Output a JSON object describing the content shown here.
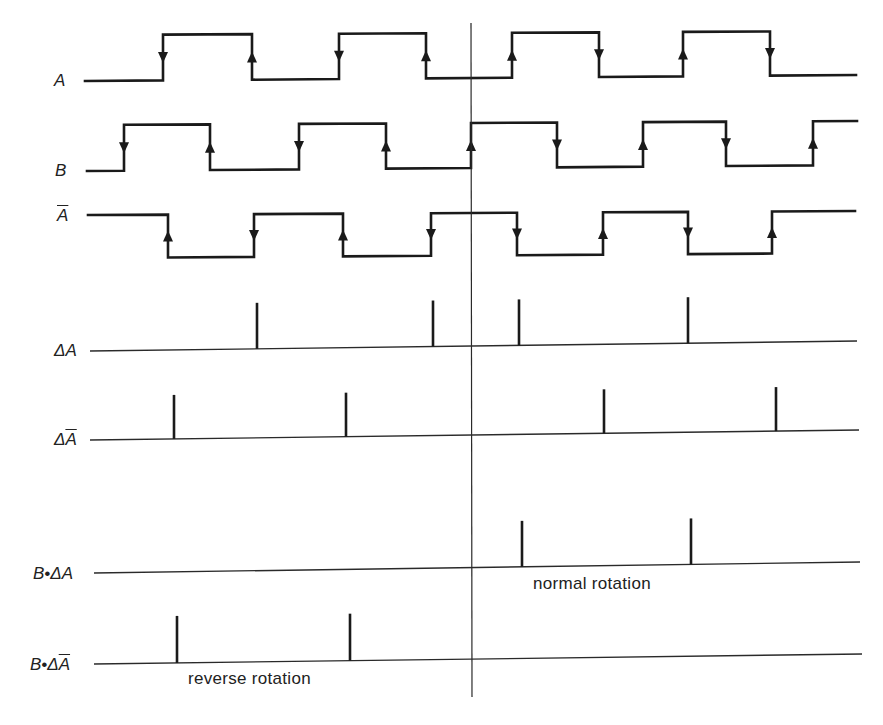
{
  "diagram": {
    "marker_x": 471,
    "marker_y": [
      23,
      697
    ],
    "signals": [
      {
        "id": "A",
        "label": "A",
        "label_overbar": "",
        "label_pos": [
          54,
          72
        ],
        "high_y": 35,
        "low_y": 81,
        "start_x": 85,
        "end_x": 856,
        "start_level": "low",
        "edges": [
          {
            "x": 163,
            "arrow": "down"
          },
          {
            "x": 252,
            "arrow": "up"
          },
          {
            "x": 339,
            "arrow": "down"
          },
          {
            "x": 426,
            "arrow": "up"
          },
          {
            "x": 512,
            "arrow": "up"
          },
          {
            "x": 599,
            "arrow": "down"
          },
          {
            "x": 683,
            "arrow": "up"
          },
          {
            "x": 770,
            "arrow": "down"
          }
        ]
      },
      {
        "id": "B",
        "label": "B",
        "label_overbar": "",
        "label_pos": [
          55,
          162
        ],
        "high_y": 125,
        "low_y": 171,
        "right_high_y": 121,
        "right_low_y": 165,
        "start_x": 87,
        "end_x": 857,
        "start_level": "low",
        "edges": [
          {
            "x": 124,
            "arrow": "down"
          },
          {
            "x": 210,
            "arrow": "up"
          },
          {
            "x": 299,
            "arrow": "down"
          },
          {
            "x": 386,
            "arrow": "up"
          },
          {
            "x": 471,
            "arrow": "up"
          },
          {
            "x": 557,
            "arrow": "down"
          },
          {
            "x": 643,
            "arrow": "up"
          },
          {
            "x": 726,
            "arrow": "down"
          },
          {
            "x": 813,
            "arrow": "up"
          }
        ]
      },
      {
        "id": "A_bar",
        "label": "A",
        "label_overbar": "true",
        "label_pos": [
          57,
          207
        ],
        "high_y": 215,
        "low_y": 258,
        "right_high_y": 211,
        "right_low_y": 253,
        "start_x": 88,
        "end_x": 855,
        "start_level": "high",
        "edges": [
          {
            "x": 168,
            "arrow": "up"
          },
          {
            "x": 254,
            "arrow": "down"
          },
          {
            "x": 343,
            "arrow": "up"
          },
          {
            "x": 431,
            "arrow": "down"
          },
          {
            "x": 517,
            "arrow": "down"
          },
          {
            "x": 603,
            "arrow": "up"
          },
          {
            "x": 688,
            "arrow": "down"
          },
          {
            "x": 772,
            "arrow": "up"
          }
        ]
      }
    ],
    "pulse_rows": [
      {
        "id": "delta_A",
        "label_prefix": "Δ",
        "label_main": "A",
        "label_overbar": false,
        "label_pos": [
          54,
          342
        ],
        "line_y_left": 351,
        "line_y_right": 341,
        "line_start_x": 90,
        "line_end_x": 857,
        "pulse_height": 46,
        "pulses_x": [
          257,
          433,
          519,
          688
        ]
      },
      {
        "id": "delta_A_bar",
        "label_prefix": "Δ",
        "label_main": "A",
        "label_overbar": true,
        "label_pos": [
          54,
          431
        ],
        "line_y_left": 440,
        "line_y_right": 430,
        "line_start_x": 90,
        "line_end_x": 859,
        "pulse_height": 44,
        "pulses_x": [
          174,
          346,
          604,
          776
        ]
      },
      {
        "id": "B_delta_A",
        "label_prefix": "B•Δ",
        "label_main": "A",
        "label_overbar": false,
        "label_pos": [
          33,
          565
        ],
        "line_y_left": 573,
        "line_y_right": 562,
        "line_start_x": 94,
        "line_end_x": 860,
        "pulse_height": 46,
        "pulses_x": [
          522,
          691
        ]
      },
      {
        "id": "B_delta_A_bar",
        "label_prefix": "B•Δ",
        "label_main": "A",
        "label_overbar": true,
        "label_pos": [
          30,
          656
        ],
        "line_y_left": 664,
        "line_y_right": 654,
        "line_start_x": 94,
        "line_end_x": 862,
        "pulse_height": 47,
        "pulses_x": [
          177,
          350
        ]
      }
    ],
    "captions": [
      {
        "text": "normal rotation",
        "x": 533,
        "y": 575
      },
      {
        "text": "reverse rotation",
        "x": 188,
        "y": 670
      }
    ]
  },
  "labels": {
    "a": "A",
    "b": "B",
    "a_bar": "A",
    "delta_a_prefix": "Δ",
    "delta_a_main": "A",
    "delta_a_bar_prefix": "Δ",
    "delta_a_bar_main": "A",
    "b_delta_a_prefix": "B•Δ",
    "b_delta_a_main": "A",
    "b_delta_a_bar_prefix": "B•Δ",
    "b_delta_a_bar_main": "A",
    "normal_rotation": "normal rotation",
    "reverse_rotation": "reverse rotation"
  }
}
